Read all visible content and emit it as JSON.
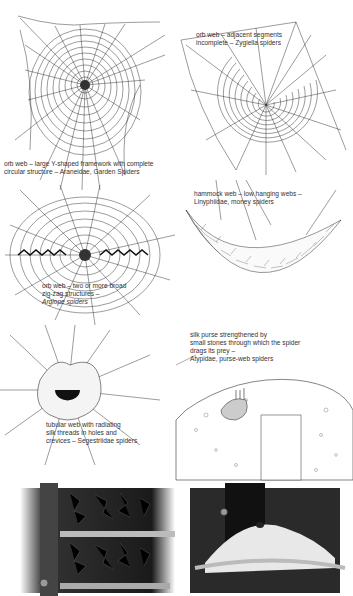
{
  "figures": [
    {
      "id": "orb-web-araneidae",
      "caption": [
        "orb web – large Y-shaped framework with complete",
        "circular structure – Araneidae, Garden Spiders"
      ]
    },
    {
      "id": "orb-web-zygiella",
      "caption": [
        "orb web – adjacent segments",
        "incomplete – Zygiella spiders"
      ]
    },
    {
      "id": "orb-web-argiope",
      "caption": [
        "orb web – two or more broad",
        "zig-zag structures –",
        "Argiope spiders"
      ]
    },
    {
      "id": "hammock-web",
      "caption": [
        "hammock web – low hanging webs –",
        "Linyphiidae, money spiders"
      ]
    },
    {
      "id": "tubular-web",
      "caption": [
        "tubular web with radiating",
        "silk threads in holes and",
        "crevices – Segestriidae spiders"
      ]
    },
    {
      "id": "purse-web",
      "caption": [
        "silk purse strengthened by",
        "small stones through which the spider",
        "drags its prey –",
        "Atypidae, purse-web spiders"
      ]
    },
    {
      "id": "cobweb-shelf-drawing",
      "caption": []
    },
    {
      "id": "funnel-corner-drawing",
      "caption": []
    }
  ],
  "colors": {
    "ink": "#222222",
    "paper": "#ffffff",
    "charcoal": "#1a1a1a"
  }
}
